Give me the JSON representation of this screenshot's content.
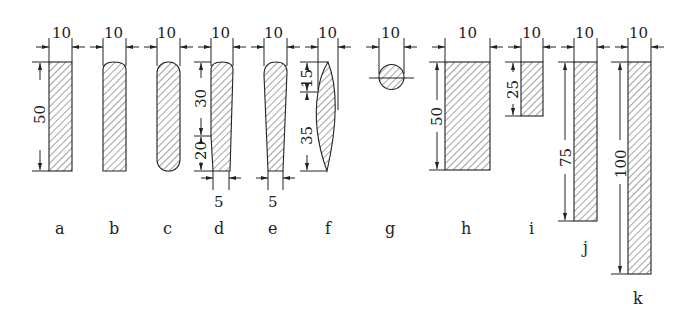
{
  "diagram": {
    "type": "cross-section profiles",
    "profiles": [
      {
        "id": "a",
        "label": "a",
        "shape": "rectangle",
        "width": "10",
        "height": "50"
      },
      {
        "id": "b",
        "label": "b",
        "shape": "rectangle-rounded-top",
        "width": "10"
      },
      {
        "id": "c",
        "label": "c",
        "shape": "rounded-both-ends",
        "width": "10"
      },
      {
        "id": "d",
        "label": "d",
        "shape": "tapered-rounded-top",
        "width": "10",
        "upper": "30",
        "lower": "20",
        "bottom_width": "5"
      },
      {
        "id": "e",
        "label": "e",
        "shape": "tapered-rounded-top",
        "width": "10",
        "bottom_width": "5"
      },
      {
        "id": "f",
        "label": "f",
        "shape": "lens",
        "width": "10",
        "upper": "15",
        "lower": "35"
      },
      {
        "id": "g",
        "label": "g",
        "shape": "circle",
        "width": "10"
      },
      {
        "id": "h",
        "label": "h",
        "shape": "rectangle",
        "width": "10",
        "height": "50"
      },
      {
        "id": "i",
        "label": "i",
        "shape": "rectangle",
        "width": "10",
        "height": "25"
      },
      {
        "id": "j",
        "label": "j",
        "shape": "rectangle",
        "width": "10",
        "height": "75"
      },
      {
        "id": "k",
        "label": "k",
        "shape": "rectangle",
        "width": "10",
        "height": "100"
      }
    ]
  }
}
